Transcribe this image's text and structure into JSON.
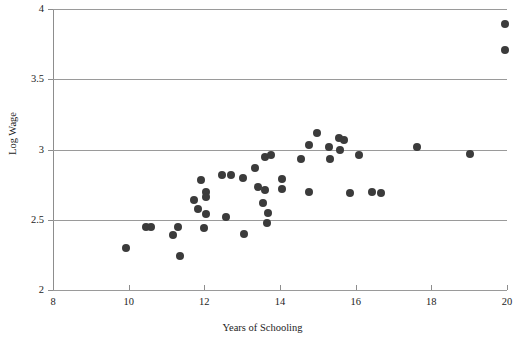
{
  "chart_data": {
    "type": "scatter",
    "title": "",
    "xlabel": "Years of Schooling",
    "ylabel": "Log Wage",
    "xlim": [
      8,
      20
    ],
    "ylim": [
      2,
      4
    ],
    "xticks": [
      8,
      10,
      12,
      14,
      16,
      18,
      20
    ],
    "xticklabels": [
      "8",
      "10",
      "12",
      "14",
      "16",
      "18",
      "20"
    ],
    "yticks": [
      2,
      2.5,
      3,
      3.5,
      4
    ],
    "yticklabels": [
      "2",
      "2.5",
      "3",
      "3.5",
      "4"
    ],
    "grid": "horizontal",
    "legend": "none",
    "marker": {
      "shape": "circle",
      "color": "#3b3b3b",
      "size_px": 8
    },
    "points": [
      {
        "x": 9.93,
        "y": 2.3
      },
      {
        "x": 11.18,
        "y": 2.39
      },
      {
        "x": 11.31,
        "y": 2.45
      },
      {
        "x": 11.37,
        "y": 2.24
      },
      {
        "x": 10.46,
        "y": 2.45
      },
      {
        "x": 10.59,
        "y": 2.45
      },
      {
        "x": 11.9,
        "y": 2.78
      },
      {
        "x": 11.74,
        "y": 2.64
      },
      {
        "x": 12.05,
        "y": 2.7
      },
      {
        "x": 12.05,
        "y": 2.66
      },
      {
        "x": 11.82,
        "y": 2.58
      },
      {
        "x": 12.05,
        "y": 2.54
      },
      {
        "x": 12.0,
        "y": 2.44
      },
      {
        "x": 12.48,
        "y": 2.82
      },
      {
        "x": 12.71,
        "y": 2.82
      },
      {
        "x": 13.05,
        "y": 2.4
      },
      {
        "x": 12.58,
        "y": 2.52
      },
      {
        "x": 13.34,
        "y": 2.87
      },
      {
        "x": 13.6,
        "y": 2.95
      },
      {
        "x": 13.76,
        "y": 2.96
      },
      {
        "x": 13.02,
        "y": 2.8
      },
      {
        "x": 13.42,
        "y": 2.73
      },
      {
        "x": 13.6,
        "y": 2.71
      },
      {
        "x": 14.05,
        "y": 2.72
      },
      {
        "x": 13.55,
        "y": 2.62
      },
      {
        "x": 13.68,
        "y": 2.55
      },
      {
        "x": 13.65,
        "y": 2.48
      },
      {
        "x": 14.05,
        "y": 2.79
      },
      {
        "x": 14.97,
        "y": 3.12
      },
      {
        "x": 15.55,
        "y": 3.08
      },
      {
        "x": 15.68,
        "y": 3.07
      },
      {
        "x": 14.76,
        "y": 3.03
      },
      {
        "x": 15.29,
        "y": 3.02
      },
      {
        "x": 15.58,
        "y": 3.0
      },
      {
        "x": 16.08,
        "y": 2.96
      },
      {
        "x": 15.32,
        "y": 2.93
      },
      {
        "x": 14.55,
        "y": 2.93
      },
      {
        "x": 14.76,
        "y": 2.7
      },
      {
        "x": 15.84,
        "y": 2.69
      },
      {
        "x": 16.42,
        "y": 2.7
      },
      {
        "x": 17.63,
        "y": 3.02
      },
      {
        "x": 19.03,
        "y": 2.97
      },
      {
        "x": 16.68,
        "y": 2.69
      },
      {
        "x": 19.95,
        "y": 3.89
      },
      {
        "x": 19.95,
        "y": 3.71
      }
    ]
  },
  "axes": {
    "x_title": "Years of Schooling",
    "y_title": "Log Wage"
  }
}
